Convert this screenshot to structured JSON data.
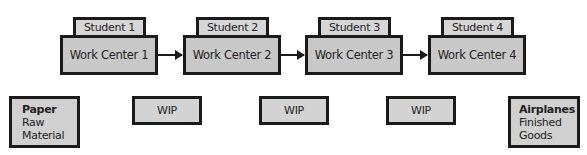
{
  "work_centers": [
    {
      "student": "Student 1",
      "label": "Work Center 1"
    },
    {
      "student": "Student 2",
      "label": "Work Center 2"
    },
    {
      "student": "Student 3",
      "label": "Work Center 3"
    },
    {
      "student": "Student 4",
      "label": "Work Center 4"
    }
  ],
  "raw_material": {
    "title": "Paper",
    "line1": "Raw",
    "line2": "Material"
  },
  "wip": [
    "WIP",
    "WIP",
    "WIP"
  ],
  "finished_goods": {
    "title": "Airplanes",
    "line1": "Finished",
    "line2": "Goods"
  },
  "colors": {
    "box_fill": "#c8c8c8",
    "border": "#1a1a1a"
  }
}
